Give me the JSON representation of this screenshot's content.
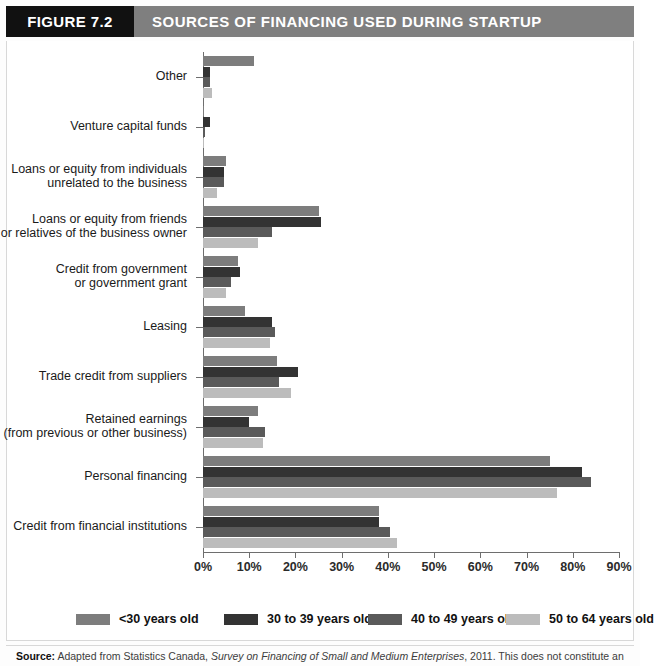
{
  "header": {
    "figure_tag": "FIGURE 7.2",
    "title": "SOURCES OF FINANCING USED DURING STARTUP"
  },
  "legend": {
    "items": [
      {
        "label": "<30 years old",
        "color": "#7d7d7d"
      },
      {
        "label": "30 to 39 years old",
        "color": "#333333"
      },
      {
        "label": "40 to 49 years old",
        "color": "#5a5a5a"
      },
      {
        "label": "50 to 64 years old",
        "color": "#bcbcbc"
      }
    ]
  },
  "source": {
    "prefix": "Source:",
    "text_before_italic": " Adapted from Statistics Canada, ",
    "italic": "Survey on Financing of Small and Medium Enterprises",
    "text_after_italic": ", 2011. This does not constitute an"
  },
  "chart_data": {
    "type": "bar",
    "orientation": "horizontal",
    "title": "SOURCES OF FINANCING USED DURING STARTUP",
    "xlabel": "",
    "ylabel": "",
    "xlim": [
      0,
      90
    ],
    "xticks": [
      0,
      10,
      20,
      30,
      40,
      50,
      60,
      70,
      80,
      90
    ],
    "xtick_labels": [
      "0%",
      "10%",
      "20%",
      "30%",
      "40%",
      "50%",
      "60%",
      "70%",
      "80%",
      "90%"
    ],
    "grid": false,
    "legend_position": "bottom",
    "categories": [
      "Other",
      "Venture capital funds",
      "Loans or equity from individuals\nunrelated to the business",
      "Loans or equity from friends\nor relatives of the business owner",
      "Credit from government\nor government grant",
      "Leasing",
      "Trade credit from suppliers",
      "Retained earnings\n(from previous or other business)",
      "Personal financing",
      "Credit from financial institutions"
    ],
    "series": [
      {
        "name": "<30 years old",
        "color": "#7d7d7d",
        "values": [
          11.0,
          0.3,
          5.0,
          25.0,
          7.5,
          9.0,
          16.0,
          12.0,
          75.0,
          38.0
        ]
      },
      {
        "name": "30 to 39 years old",
        "color": "#333333",
        "values": [
          1.5,
          1.5,
          4.5,
          25.5,
          8.0,
          15.0,
          20.5,
          10.0,
          82.0,
          38.0
        ]
      },
      {
        "name": "40 to 49 years old",
        "color": "#5a5a5a",
        "values": [
          1.5,
          0.5,
          4.5,
          15.0,
          6.0,
          15.5,
          16.5,
          13.5,
          84.0,
          40.5
        ]
      },
      {
        "name": "50 to 64 years old",
        "color": "#bcbcbc",
        "values": [
          2.0,
          0.2,
          3.0,
          12.0,
          5.0,
          14.5,
          19.0,
          13.0,
          76.5,
          42.0
        ]
      }
    ]
  }
}
